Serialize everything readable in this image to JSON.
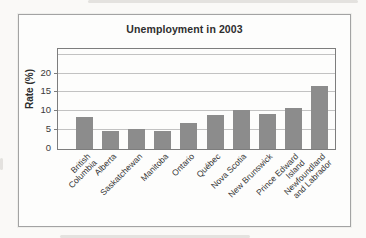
{
  "chart_data": {
    "type": "bar",
    "title": "Unemployment in 2003",
    "xlabel": "",
    "ylabel": "Rate (%)",
    "categories": [
      "British Columbia",
      "Alberta",
      "Saskatchewan",
      "Manitoba",
      "Ontario",
      "Québec",
      "Nova Scotia",
      "New Brunswick",
      "Prince Edward Island",
      "Newfoundland and Labrador"
    ],
    "category_label_lines": [
      [
        "British",
        "Columbia"
      ],
      [
        "Alberta"
      ],
      [
        "Saskatchewan"
      ],
      [
        "Manitoba"
      ],
      [
        "Ontario"
      ],
      [
        "Québec"
      ],
      [
        "Nova Scotia"
      ],
      [
        "New Brunswick"
      ],
      [
        "Prince Edward",
        "Island"
      ],
      [
        "Newfoundland",
        "and Labrador"
      ]
    ],
    "values": [
      8.6,
      4.9,
      5.4,
      4.7,
      6.8,
      9.0,
      10.3,
      9.2,
      10.9,
      16.6
    ],
    "ylim": [
      0,
      26.5
    ],
    "yticks": [
      0,
      5,
      10,
      15,
      20
    ],
    "gridlines": [
      5,
      10,
      15,
      20,
      25
    ],
    "grid": true,
    "legend": false,
    "colors": {
      "bar": "#8c8c8c",
      "gridline": "#c2c2c2",
      "plot_border": "#7d7d7d",
      "figure_border": "#a3a3a3",
      "text": "#2e2e2e"
    }
  }
}
